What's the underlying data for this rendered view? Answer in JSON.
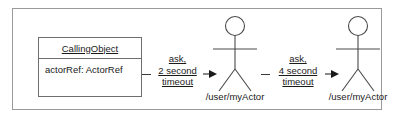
{
  "diagram": {
    "type": "uml-communication-diagram",
    "frame": {
      "name": "diagram-frame"
    },
    "object_box": {
      "name": "CallingObject",
      "name_underlined": true,
      "attribute": "actorRef: ActorRef"
    },
    "messages": [
      {
        "id": "message-1",
        "lines": [
          "ask,",
          "2 second",
          "timeout"
        ],
        "direction": "right",
        "from": "CallingObject",
        "to": "/user/myActor"
      },
      {
        "id": "message-2",
        "lines": [
          "ask,",
          "4 second",
          "timeout"
        ],
        "direction": "right",
        "from": "/user/myActor",
        "to": "/user/myActor"
      }
    ],
    "actors": [
      {
        "id": "actor-1",
        "label": "/user/myActor"
      },
      {
        "id": "actor-2",
        "label": "/user/myActor"
      }
    ],
    "colors": {
      "frame_border": "#9a9a9a",
      "box_border": "#6e6e6e",
      "stroke": "#3a3a3a",
      "text": "#1a1a1a",
      "background": "#ffffff"
    }
  }
}
